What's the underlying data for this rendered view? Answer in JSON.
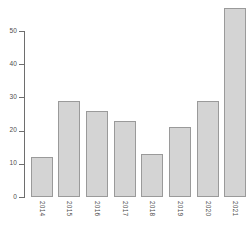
{
  "chart_data": {
    "type": "bar",
    "title": "",
    "subtitle": "",
    "xlabel": "",
    "ylabel": "",
    "categories": [
      "2014",
      "2015",
      "2016",
      "2017",
      "2018",
      "2019",
      "2020",
      "2021"
    ],
    "values": [
      12,
      29,
      26,
      23,
      13,
      21,
      29,
      57
    ],
    "ylim": [
      0,
      50
    ],
    "y_ticks": [
      0,
      10,
      20,
      30,
      40,
      50
    ],
    "y_tick_labels": [
      "0",
      "10",
      "20",
      "30",
      "40",
      "50"
    ],
    "grid": false,
    "legend": false,
    "legend_position": "none",
    "colors": {
      "bar_fill": "#d4d4d4",
      "bar_border": "#9a9a9a",
      "axis": "#6e6e6e",
      "text": "#4d4d4d",
      "background": "#ffffff"
    }
  }
}
